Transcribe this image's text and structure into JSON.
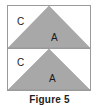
{
  "figure": {
    "caption": "Figure 5",
    "fill_color": "#a8a8a8",
    "stroke_color": "#8f8f8f",
    "border_color": "#9a9a9a",
    "background_color": "#ffffff",
    "panels": [
      {
        "name": "top-panel",
        "shape": "triangle",
        "shape_label": "A",
        "region_label": "C"
      },
      {
        "name": "bottom-panel",
        "shape": "triangle",
        "shape_label": "A",
        "region_label": "C"
      }
    ]
  }
}
